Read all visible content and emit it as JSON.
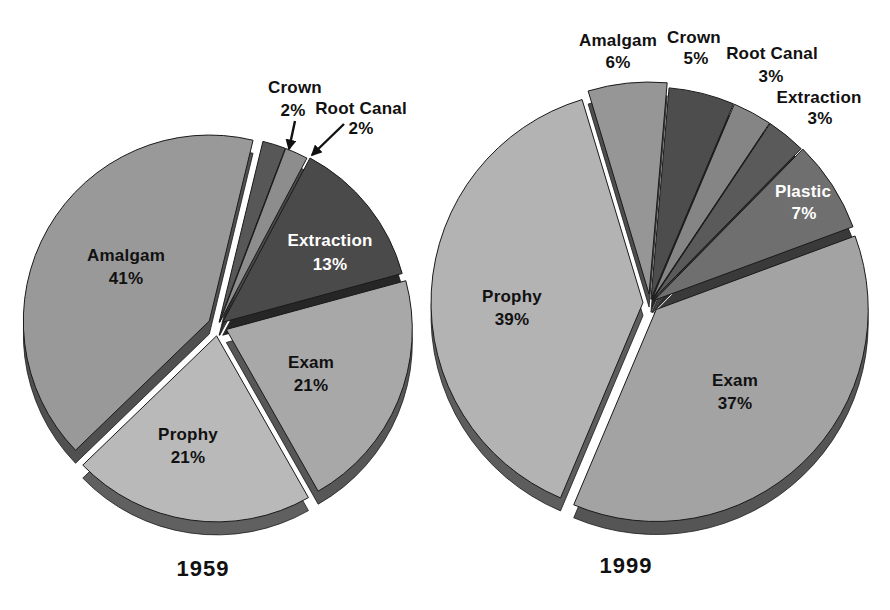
{
  "chart_data": [
    {
      "type": "pie",
      "title": "1959",
      "unit": "%",
      "style": "3d-exploded",
      "legend": "none",
      "slices": [
        {
          "label": "Crown",
          "pct_label": "2%",
          "value": 2,
          "color": "#575757",
          "text_color": "#111111",
          "explode": 4,
          "label_placement": "outside",
          "label_xy": [
            295,
            93,
            293,
            116
          ],
          "callout": {
            "from": [
              295,
              121
            ],
            "to": [
              289,
              149
            ]
          }
        },
        {
          "label": "Root Canal",
          "pct_label": "2%",
          "value": 2,
          "color": "#8d8d8d",
          "text_color": "#111111",
          "explode": 4,
          "label_placement": "outside",
          "label_xy": [
            361,
            114,
            361,
            134
          ],
          "callout": {
            "from": [
              344,
              124
            ],
            "to": [
              312,
              155
            ]
          }
        },
        {
          "label": "Extraction",
          "pct_label": "13%",
          "value": 13,
          "color": "#4a4a4a",
          "text_color": "#ffffff",
          "explode": 6,
          "label_placement": "inside",
          "label_xy": [
            330,
            246,
            330,
            270
          ]
        },
        {
          "label": "Exam",
          "pct_label": "21%",
          "value": 21,
          "color": "#a8a8a8",
          "text_color": "#111111",
          "explode": 9,
          "label_placement": "inside",
          "label_xy": [
            311,
            368,
            311,
            391
          ]
        },
        {
          "label": "Prophy",
          "pct_label": "21%",
          "value": 21,
          "color": "#b9b9b9",
          "text_color": "#111111",
          "explode": 10,
          "label_placement": "inside",
          "label_xy": [
            188,
            440,
            188,
            463
          ]
        },
        {
          "label": "Amalgam",
          "pct_label": "41%",
          "value": 41,
          "color": "#999999",
          "text_color": "#111111",
          "explode": 10,
          "label_placement": "inside",
          "label_xy": [
            126,
            261,
            126,
            284
          ]
        }
      ],
      "layout": {
        "cx": 218,
        "cy": 326,
        "r": 186,
        "depth": 13,
        "start_angle": 13.6,
        "title_xy": [
          203,
          569
        ]
      }
    },
    {
      "type": "pie",
      "title": "1999",
      "unit": "%",
      "style": "3d-exploded",
      "legend": "none",
      "slices": [
        {
          "label": "Amalgam",
          "pct_label": "6%",
          "value": 6,
          "color": "#969696",
          "text_color": "#111111",
          "explode": 9,
          "label_placement": "outside",
          "label_xy": [
            618,
            46,
            618,
            68
          ]
        },
        {
          "label": "Crown",
          "pct_label": "5%",
          "value": 5,
          "color": "#4d4d4d",
          "text_color": "#111111",
          "explode": 4,
          "label_placement": "outside",
          "label_xy": [
            694,
            43,
            696,
            64
          ]
        },
        {
          "label": "Root Canal",
          "pct_label": "3%",
          "value": 3,
          "color": "#858585",
          "text_color": "#111111",
          "explode": 4,
          "label_placement": "outside",
          "label_xy": [
            772,
            59,
            771,
            82
          ]
        },
        {
          "label": "Extraction",
          "pct_label": "3%",
          "value": 3,
          "color": "#5a5a5a",
          "text_color": "#111111",
          "explode": 4,
          "label_placement": "outside",
          "label_xy": [
            819,
            103,
            820,
            124
          ]
        },
        {
          "label": "Plastic",
          "pct_label": "7%",
          "value": 7,
          "color": "#6f6f6f",
          "text_color": "#ffffff",
          "explode": 5,
          "label_placement": "inside",
          "label_xy": [
            803,
            197,
            804,
            219
          ]
        },
        {
          "label": "Exam",
          "pct_label": "37%",
          "value": 37,
          "color": "#a3a3a3",
          "text_color": "#111111",
          "explode": 9,
          "label_placement": "inside",
          "label_xy": [
            735,
            386,
            735,
            409
          ]
        },
        {
          "label": "Prophy",
          "pct_label": "39%",
          "value": 39,
          "color": "#b3b3b3",
          "text_color": "#111111",
          "explode": 7,
          "label_placement": "inside",
          "label_xy": [
            512,
            302,
            512,
            325
          ]
        }
      ],
      "layout": {
        "cx": 650,
        "cy": 303,
        "r": 212,
        "depth": 13,
        "start_angle": -16.7,
        "title_xy": [
          626,
          566
        ]
      }
    }
  ]
}
